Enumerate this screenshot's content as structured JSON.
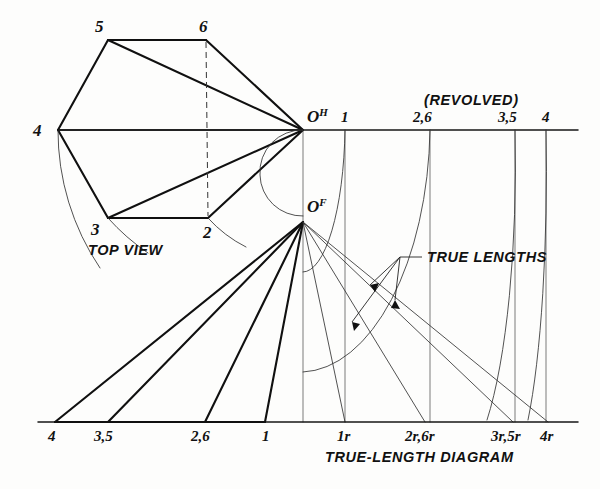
{
  "figure": {
    "title_bottom": "TRUE-LENGTH DIAGRAM",
    "top_view_label": "TOP VIEW",
    "revolved_label": "(REVOLVED)",
    "true_lengths_label": "TRUE LENGTHS"
  },
  "top_view": {
    "vertices": [
      {
        "name": "5",
        "x": 108,
        "y": 40
      },
      {
        "name": "6",
        "x": 206,
        "y": 40
      },
      {
        "name": "4",
        "x": 58,
        "y": 130
      },
      {
        "name": "3",
        "x": 108,
        "y": 218
      },
      {
        "name": "2",
        "x": 208,
        "y": 218
      }
    ],
    "apex": {
      "name": "O",
      "superscript": "H",
      "x": 303,
      "y": 130
    }
  },
  "front_view": {
    "apex": {
      "name": "O",
      "superscript": "F",
      "x": 303,
      "y": 222
    }
  },
  "revolved_axis": {
    "y": 130,
    "x_start": 58,
    "x_end": 578,
    "ticks": [
      {
        "label": "1",
        "x": 345
      },
      {
        "label": "2,6",
        "x": 430
      },
      {
        "label": "3,5",
        "x": 515
      },
      {
        "label": "4",
        "x": 546
      }
    ]
  },
  "baseline": {
    "y": 422,
    "x_start": 38,
    "x_end": 578,
    "left_marks": [
      {
        "label": "4",
        "x": 55
      },
      {
        "label": "3,5",
        "x": 108
      },
      {
        "label": "2,6",
        "x": 205
      },
      {
        "label": "1",
        "x": 265
      }
    ],
    "right_marks": [
      {
        "label": "1r",
        "x": 345
      },
      {
        "label": "2r,6r",
        "x": 425
      },
      {
        "label": "3r,5r",
        "x": 513
      },
      {
        "label": "4r",
        "x": 548
      }
    ]
  },
  "colors": {
    "ink": "#111111",
    "light_ink": "#333333",
    "paper": "#fdfdfc"
  }
}
